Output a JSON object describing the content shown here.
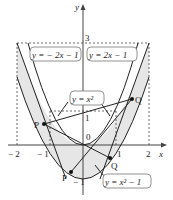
{
  "axes": {
    "x_label": "x",
    "y_label": "y",
    "origin_label": "0",
    "x_ticks": [
      "− 2",
      "− 1",
      "1",
      "2"
    ],
    "y_ticks": [
      "3",
      "1",
      "− 1"
    ]
  },
  "curves": [
    {
      "name": "y = -2x - 1",
      "label": "y = − 2x − 1"
    },
    {
      "name": "y = 2x - 1",
      "label": "y = 2x − 1"
    },
    {
      "name": "y = x^2",
      "label": "y = x²"
    },
    {
      "name": "y = x^2 - 1",
      "label": "y = x² − 1"
    }
  ],
  "points": [
    {
      "label": "P",
      "position": "upper-left"
    },
    {
      "label": "Q",
      "position": "upper-right"
    },
    {
      "label": "P",
      "position": "lower-left"
    },
    {
      "label": "Q",
      "position": "lower-right"
    }
  ],
  "colors": {
    "shade": "#e6e6e6",
    "curve": "#222222",
    "dashed": "#444444"
  }
}
